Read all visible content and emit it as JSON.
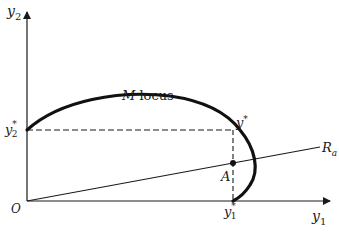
{
  "diagram": {
    "type": "economics-production-locus",
    "axes": {
      "x_label": "y",
      "x_sub": "1",
      "y_label": "y",
      "y_sub": "2",
      "origin_label": "O"
    },
    "curve": {
      "label_italic": "M",
      "label_rest": " locus"
    },
    "ray": {
      "label": "R",
      "label_sub": "a"
    },
    "points": {
      "y_star": "y",
      "y_star_sup": "*",
      "y1_star": "y",
      "y1_star_sub": "1",
      "y1_star_sup": "*",
      "y2_star": "y",
      "y2_star_sub": "2",
      "y2_star_sup": "*",
      "A": "A"
    }
  }
}
